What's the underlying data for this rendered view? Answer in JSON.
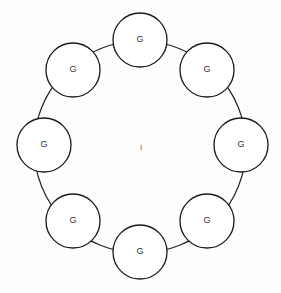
{
  "diagram": {
    "type": "ring-of-nodes",
    "ring": {
      "cx": 140,
      "cy": 147,
      "r": 106,
      "stroke": "#222222"
    },
    "center_label": "I",
    "node_radius": 27,
    "nodes": [
      {
        "id": "n-top",
        "label": "G",
        "cx": 140,
        "cy": 40
      },
      {
        "id": "n-top-right",
        "label": "G",
        "cx": 207,
        "cy": 70
      },
      {
        "id": "n-right",
        "label": "G",
        "cx": 241,
        "cy": 145
      },
      {
        "id": "n-bottom-right",
        "label": "G",
        "cx": 207,
        "cy": 221
      },
      {
        "id": "n-bottom",
        "label": "G",
        "cx": 140,
        "cy": 252
      },
      {
        "id": "n-bottom-left",
        "label": "G",
        "cx": 73,
        "cy": 221
      },
      {
        "id": "n-left",
        "label": "G",
        "cx": 44,
        "cy": 145
      },
      {
        "id": "n-top-left",
        "label": "G",
        "cx": 73,
        "cy": 70
      }
    ]
  }
}
